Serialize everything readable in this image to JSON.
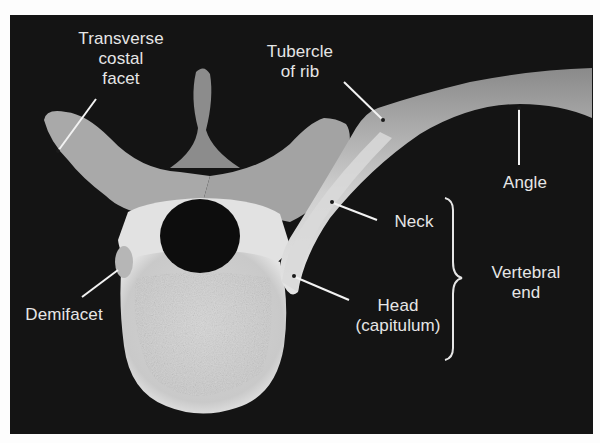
{
  "figure": {
    "background_color": "#141414",
    "label_color": "#e6e6e6",
    "bone_color": "#d8d8d8"
  },
  "labels": {
    "transverse_costal_facet": "Transverse\ncostal\nfacet",
    "tubercle_of_rib": "Tubercle\nof rib",
    "angle": "Angle",
    "neck": "Neck",
    "vertebral_end": "Vertebral\nend",
    "head": "Head\n(capitulum)",
    "demifacet": "Demifacet"
  }
}
